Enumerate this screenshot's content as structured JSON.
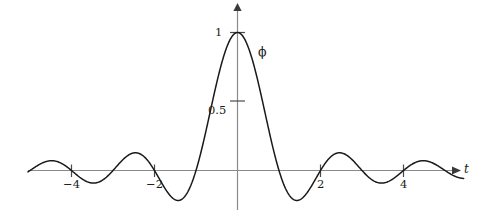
{
  "chart_data": {
    "type": "line",
    "title": "",
    "subtitle": "",
    "xlabel": "t",
    "ylabel": "",
    "curve_label": "ϕ",
    "xlim": [
      -5.05,
      5.45
    ],
    "ylim": [
      -0.32,
      1.12
    ],
    "grid": false,
    "legend": "none",
    "x_ticks": [
      {
        "value": -4,
        "label": "−4"
      },
      {
        "value": -2,
        "label": "−2"
      },
      {
        "value": 2,
        "label": "2"
      },
      {
        "value": 4,
        "label": "4"
      }
    ],
    "y_ticks": [
      {
        "value": 0.5,
        "label": "0.5"
      },
      {
        "value": 1,
        "label": "1"
      }
    ],
    "series": [
      {
        "name": "ϕ",
        "description": "sinc scaling function",
        "color": "#1a1a1a",
        "points": [
          {
            "x": -5.05,
            "y": -0.0063
          },
          {
            "x": -4.9,
            "y": -0.0205
          },
          {
            "x": -4.75,
            "y": -0.0334
          },
          {
            "x": -4.6,
            "y": -0.0434
          },
          {
            "x": -4.45,
            "y": -0.0494
          },
          {
            "x": -4.3,
            "y": -0.0505
          },
          {
            "x": -4.15,
            "y": -0.0464
          },
          {
            "x": -4.0,
            "y": 0.0
          },
          {
            "x": -3.95,
            "y": -0.0262
          },
          {
            "x": -3.8,
            "y": -0.0157
          },
          {
            "x": -3.65,
            "y": 0.0219
          },
          {
            "x": -3.5,
            "y": 0.0455
          },
          {
            "x": -3.35,
            "y": 0.0625
          },
          {
            "x": -3.2,
            "y": 0.0645
          },
          {
            "x": -3.05,
            "y": 0.0515
          },
          {
            "x": -3.0,
            "y": 0.0
          },
          {
            "x": -2.9,
            "y": 0.0272
          },
          {
            "x": -2.75,
            "y": -0.0138
          },
          {
            "x": -2.6,
            "y": -0.0466
          },
          {
            "x": -2.45,
            "y": -0.0734
          },
          {
            "x": -2.3,
            "y": -0.0872
          },
          {
            "x": -2.15,
            "y": -0.0795
          },
          {
            "x": -2.0,
            "y": 0.0
          },
          {
            "x": -1.9,
            "y": 0.0518
          },
          {
            "x": -1.75,
            "y": 0.1286
          },
          {
            "x": -1.6,
            "y": 0.1514
          },
          {
            "x": -1.45,
            "y": 0.1227
          },
          {
            "x": -1.3,
            "y": 0.0581
          },
          {
            "x": -1.15,
            "y": -0.0195
          },
          {
            "x": -1.0,
            "y": 0.0
          },
          {
            "x": -0.9,
            "y": -0.1093
          },
          {
            "x": -0.75,
            "y": -0.3001
          },
          {
            "x": -0.6,
            "y": -0.1559
          },
          {
            "x": -0.5,
            "y": 0.0
          },
          {
            "x": -0.4,
            "y": 0.2387
          },
          {
            "x": -0.3,
            "y": 0.5105
          },
          {
            "x": -0.2,
            "y": 0.7568
          },
          {
            "x": -0.1,
            "y": 0.9355
          },
          {
            "x": 0.0,
            "y": 1.0
          },
          {
            "x": 0.1,
            "y": 0.9355
          },
          {
            "x": 0.2,
            "y": 0.7568
          },
          {
            "x": 0.3,
            "y": 0.5105
          },
          {
            "x": 0.4,
            "y": 0.2387
          },
          {
            "x": 0.5,
            "y": 0.0
          },
          {
            "x": 0.6,
            "y": -0.1559
          },
          {
            "x": 0.75,
            "y": -0.3001
          },
          {
            "x": 0.9,
            "y": -0.1093
          },
          {
            "x": 1.0,
            "y": 0.0
          },
          {
            "x": 1.15,
            "y": -0.0195
          },
          {
            "x": 1.3,
            "y": 0.0581
          },
          {
            "x": 1.45,
            "y": 0.1227
          },
          {
            "x": 1.6,
            "y": 0.1514
          },
          {
            "x": 1.75,
            "y": 0.1286
          },
          {
            "x": 1.9,
            "y": 0.0518
          },
          {
            "x": 2.0,
            "y": 0.0
          },
          {
            "x": 2.15,
            "y": -0.0795
          },
          {
            "x": 2.3,
            "y": -0.0872
          },
          {
            "x": 2.45,
            "y": -0.0734
          },
          {
            "x": 2.6,
            "y": -0.0466
          },
          {
            "x": 2.75,
            "y": -0.0138
          },
          {
            "x": 2.9,
            "y": 0.0272
          },
          {
            "x": 3.0,
            "y": 0.0
          },
          {
            "x": 3.05,
            "y": 0.0515
          },
          {
            "x": 3.2,
            "y": 0.0645
          },
          {
            "x": 3.35,
            "y": 0.0625
          },
          {
            "x": 3.5,
            "y": 0.0455
          },
          {
            "x": 3.65,
            "y": 0.0219
          },
          {
            "x": 3.8,
            "y": -0.0157
          },
          {
            "x": 3.95,
            "y": -0.0262
          },
          {
            "x": 4.0,
            "y": 0.0
          },
          {
            "x": 4.15,
            "y": -0.0464
          },
          {
            "x": 4.3,
            "y": -0.0505
          },
          {
            "x": 4.45,
            "y": -0.0494
          },
          {
            "x": 4.6,
            "y": -0.0434
          },
          {
            "x": 4.75,
            "y": -0.0334
          },
          {
            "x": 4.9,
            "y": -0.0205
          },
          {
            "x": 5.05,
            "y": -0.0063
          }
        ]
      }
    ],
    "notable_values": {
      "peak": {
        "x": 0,
        "y": 1
      },
      "main_trough": {
        "x": 0.75,
        "y": -0.3
      },
      "zero_crossings": [
        -5,
        -4,
        -3,
        -2,
        -1,
        -0.5,
        0.5,
        1,
        2,
        3,
        4,
        5
      ]
    },
    "axis_color": "#8a8a8a",
    "curve_color": "#1a1a1a"
  }
}
